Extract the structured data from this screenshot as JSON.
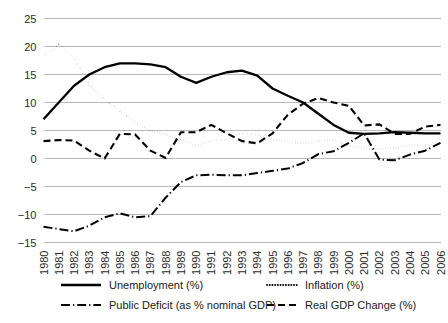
{
  "chart_data": {
    "type": "line",
    "title": "",
    "xlabel": "",
    "ylabel": "",
    "ylim": [
      -15,
      25
    ],
    "yticks": [
      25,
      20,
      15,
      10,
      5,
      0,
      -5,
      -10,
      -15
    ],
    "ytick_labels": [
      "25",
      "20",
      "15",
      "10",
      "5",
      "0",
      "−5",
      "−10",
      "−15"
    ],
    "grid": true,
    "legend_position": "bottom",
    "categories": [
      "1980",
      "1981",
      "1982",
      "1983",
      "1984",
      "1985",
      "1986",
      "1987",
      "1988",
      "1989",
      "1990",
      "1991",
      "1992",
      "1993",
      "1994",
      "1995",
      "1996",
      "1997",
      "1998",
      "1999",
      "2000",
      "2001",
      "2002",
      "2003",
      "2004",
      "2005",
      "2006"
    ],
    "x": [
      1980,
      1981,
      1982,
      1983,
      1984,
      1985,
      1986,
      1987,
      1988,
      1989,
      1990,
      1991,
      1992,
      1993,
      1994,
      1995,
      1996,
      1997,
      1998,
      1999,
      2000,
      2001,
      2002,
      2003,
      2004,
      2005,
      2006
    ],
    "series": [
      {
        "name": "Unemployment (%)",
        "style": "solid",
        "color": "#000000",
        "values": [
          7.0,
          10.0,
          13.0,
          15.0,
          16.3,
          17.0,
          17.0,
          16.8,
          16.3,
          14.6,
          13.5,
          14.6,
          15.4,
          15.7,
          14.8,
          12.5,
          11.2,
          10.0,
          8.0,
          6.0,
          4.6,
          4.4,
          4.5,
          4.7,
          4.6,
          4.5,
          4.5
        ]
      },
      {
        "name": "Inflation (%)",
        "style": "dotted",
        "color": "#000000",
        "values": [
          18.3,
          20.3,
          18.0,
          13.0,
          10.6,
          8.5,
          6.5,
          5.0,
          4.3,
          3.4,
          2.3,
          3.2,
          3.4,
          4.5,
          4.2,
          3.4,
          3.0,
          2.7,
          3.1,
          3.3,
          2.3,
          1.8,
          1.6,
          1.9,
          2.3,
          2.4,
          2.8
        ]
      },
      {
        "name": "Public Deficit (as % nominal GDP)",
        "style": "dashdot",
        "color": "#000000",
        "values": [
          -12.2,
          -12.6,
          -13.0,
          -12.0,
          -10.5,
          -9.8,
          -10.5,
          -10.3,
          -7.0,
          -4.2,
          -3.0,
          -2.9,
          -3.0,
          -3.0,
          -2.6,
          -2.2,
          -1.8,
          -0.8,
          0.8,
          1.3,
          2.8,
          4.5,
          -0.2,
          -0.3,
          0.7,
          1.4,
          2.8
        ]
      },
      {
        "name": "Real GDP Change (%)",
        "style": "dashed",
        "color": "#000000",
        "values": [
          3.1,
          3.3,
          3.2,
          1.4,
          0.0,
          4.4,
          4.3,
          1.4,
          0.1,
          4.7,
          4.7,
          6.0,
          4.5,
          3.1,
          2.7,
          4.5,
          7.8,
          9.8,
          10.8,
          10.0,
          9.4,
          5.9,
          6.1,
          4.4,
          4.4,
          5.7,
          6.0
        ]
      }
    ],
    "legend": [
      {
        "label": "Unemployment (%)",
        "style": "solid"
      },
      {
        "label": "Inflation (%)",
        "style": "dotted"
      },
      {
        "label": "Public Deficit (as % nominal GDP)",
        "style": "dashdot"
      },
      {
        "label": "Real GDP Change (%)",
        "style": "dashed"
      }
    ]
  }
}
